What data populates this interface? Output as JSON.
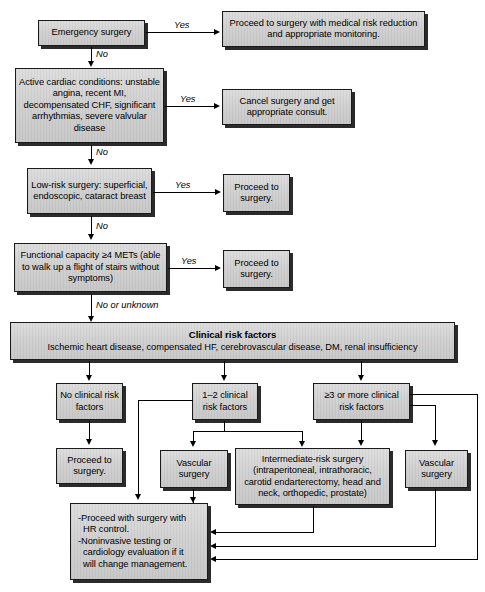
{
  "diagram": {
    "accent_color": "#d2d2d2",
    "line_color": "#000000"
  },
  "nodes": {
    "emergency_surgery": "Emergency surgery",
    "proceed_medical_risk": "Proceed to surgery with medical risk reduction and appropriate monitoring.",
    "active_cardiac": "Active cardiac conditions: unstable angina, recent MI, decompensated CHF, significant arrhythmias, severe valvular disease",
    "cancel_surgery": "Cancel surgery and get appropriate consult.",
    "low_risk_surgery": "Low-risk surgery: superficial, endoscopic, cataract breast",
    "proceed_to_surgery_1": "Proceed to surgery.",
    "functional_capacity": "Functional capacity ≥4 METs (able to walk up a flight of stairs without symptoms)",
    "proceed_to_surgery_2": "Proceed to surgery.",
    "clinical_risk_title": "Clinical risk factors",
    "clinical_risk_sub": "Ischemic heart disease, compensated HF, cerebrovascular disease, DM, renal insufficiency",
    "no_clinical_risk": "No clinical risk factors",
    "one_two_clinical_risk": "1–2 clinical risk factors",
    "three_or_more_clinical_risk": "≥3 or more clinical risk factors",
    "proceed_to_surgery_3": "Proceed to surgery.",
    "vascular_surgery_mid": "Vascular surgery",
    "intermediate_risk_surgery": "Intermediate-risk surgery (intraperitoneal, intrathoracic, carotid endarterectomy, head and neck, orthopedic, prostate)",
    "vascular_surgery_right": "Vascular surgery",
    "final_management_line1": "-Proceed with surgery with",
    "final_management_line2": "HR control.",
    "final_management_line3": "-Noninvasive testing or",
    "final_management_line4": "cardiology evaluation if it",
    "final_management_line5": "will change management."
  },
  "edge_labels": {
    "yes_1": "Yes",
    "no_1": "No",
    "yes_2": "Yes",
    "no_2": "No",
    "yes_3": "Yes",
    "no_3": "No",
    "yes_4": "Yes",
    "no_or_unknown": "No or unknown"
  }
}
